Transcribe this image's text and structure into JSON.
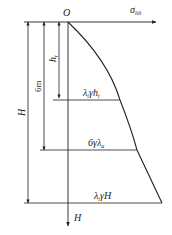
{
  "diagram": {
    "type": "earth-pressure-distribution",
    "axes": {
      "origin_label": "O",
      "horizontal_label": "σ",
      "horizontal_label_subscript": "hlt",
      "vertical_label": "H"
    },
    "dimensions": [
      {
        "label": "H",
        "from": "O",
        "to": "base"
      },
      {
        "label": "6m",
        "from": "O",
        "to": "6 m depth"
      },
      {
        "label": "h",
        "label_subscript": "t",
        "from": "O",
        "to": "h_t depth"
      }
    ],
    "pressure_labels": {
      "at_ht": {
        "text": "λ",
        "sub1": "t",
        "mid": "γh",
        "sub2": "t"
      },
      "at_6m": {
        "text": "6γλ",
        "sub1": "a"
      },
      "at_H": {
        "text": "λ",
        "sub1": "t",
        "mid": "γH"
      }
    },
    "colors": {
      "line": "#222222",
      "background": "#ffffff"
    }
  }
}
